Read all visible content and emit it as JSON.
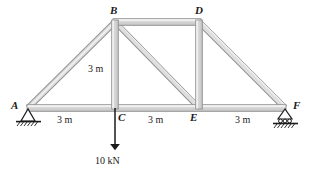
{
  "figure": {
    "type": "truss-free-body-diagram",
    "colors": {
      "member_fill": "#d2d2d2",
      "member_edge": "#8a8a8a",
      "member_highlight": "#f2f2f2",
      "line": "#1a1a1a",
      "ground_hatch": "#1a1a1a",
      "background": "#ffffff"
    }
  },
  "nodes": [
    {
      "id": "A",
      "label": "A",
      "x": 28,
      "y": 108,
      "support": "pin"
    },
    {
      "id": "B",
      "label": "B",
      "x": 115,
      "y": 22,
      "support": "none"
    },
    {
      "id": "C",
      "label": "C",
      "x": 115,
      "y": 108,
      "support": "none"
    },
    {
      "id": "D",
      "label": "D",
      "x": 199,
      "y": 22,
      "support": "none"
    },
    {
      "id": "E",
      "label": "E",
      "x": 199,
      "y": 108,
      "support": "none"
    },
    {
      "id": "F",
      "label": "F",
      "x": 285,
      "y": 108,
      "support": "roller"
    }
  ],
  "members": [
    {
      "from": "A",
      "to": "B",
      "kind": "diagonal"
    },
    {
      "from": "A",
      "to": "C",
      "kind": "bottom-chord"
    },
    {
      "from": "B",
      "to": "C",
      "kind": "vertical"
    },
    {
      "from": "B",
      "to": "D",
      "kind": "top-chord"
    },
    {
      "from": "B",
      "to": "E",
      "kind": "diagonal"
    },
    {
      "from": "C",
      "to": "E",
      "kind": "bottom-chord"
    },
    {
      "from": "D",
      "to": "E",
      "kind": "vertical"
    },
    {
      "from": "D",
      "to": "F",
      "kind": "diagonal"
    },
    {
      "from": "E",
      "to": "F",
      "kind": "bottom-chord"
    }
  ],
  "dimensions": {
    "vertical": {
      "label": "3 m",
      "value": 3,
      "unit": "m",
      "between": [
        "B",
        "C"
      ]
    },
    "bottom": [
      {
        "label": "3 m",
        "value": 3,
        "unit": "m",
        "between": [
          "A",
          "C"
        ]
      },
      {
        "label": "3 m",
        "value": 3,
        "unit": "m",
        "between": [
          "C",
          "E"
        ]
      },
      {
        "label": "3 m",
        "value": 3,
        "unit": "m",
        "between": [
          "E",
          "F"
        ]
      }
    ]
  },
  "loads": [
    {
      "label": "10 kN",
      "magnitude": 10,
      "unit": "kN",
      "at_node": "C",
      "direction": "down",
      "arrow": {
        "x": 115,
        "tail_y": 108,
        "head_y": 150
      }
    }
  ],
  "supports": {
    "A": {
      "type": "pin",
      "name": "pin-support"
    },
    "F": {
      "type": "roller",
      "name": "roller-support"
    }
  }
}
